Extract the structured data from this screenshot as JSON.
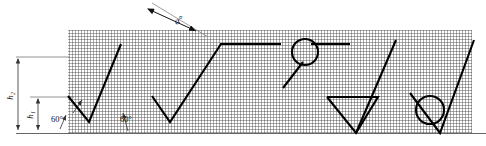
{
  "figure": {
    "type": "engineering-drawing",
    "canvas": {
      "width": 486,
      "height": 146
    },
    "colors": {
      "line": "#000000",
      "hatch": "#555555",
      "thin_line": "#777777",
      "background": "#ffffff"
    }
  },
  "block": {
    "name": "hatched-material-block",
    "x": 68,
    "y": 30,
    "width": 404,
    "height": 103,
    "hatch_spacing_px": 3
  },
  "baseline": {
    "x1": 16,
    "y1": 133,
    "x2": 486,
    "y2": 133
  },
  "dimensions": [
    {
      "id": "h2",
      "label": "h₂",
      "label_text": "h2",
      "orientation": "vertical",
      "x": 18,
      "y_top": 57,
      "y_bottom": 131,
      "label_x": 12,
      "label_y": 94
    },
    {
      "id": "h1",
      "label": "h₁",
      "label_text": "h1",
      "orientation": "vertical",
      "x": 38,
      "y_top": 97,
      "y_bottom": 131,
      "label_x": 32,
      "label_y": 114
    }
  ],
  "extension_lines": [
    {
      "x1": 16,
      "y1": 57,
      "x2": 70,
      "y2": 57
    },
    {
      "x1": 30,
      "y1": 97,
      "x2": 72,
      "y2": 97
    },
    {
      "x1": 16,
      "y1": 133,
      "x2": 72,
      "y2": 133
    }
  ],
  "angle_callouts": [
    {
      "id": "angle-left",
      "label": "60°",
      "text": "60°",
      "x": 57,
      "y": 121,
      "leader_x1": 73,
      "leader_y1": 115,
      "leader_x2": 82,
      "leader_y2": 101
    },
    {
      "id": "angle-middle",
      "label": "60°",
      "text": "60°",
      "x": 114,
      "y": 121,
      "leader_x1": 127,
      "leader_y1": 128,
      "leader_x2": 122,
      "leader_y2": 108
    }
  ],
  "top_angle": {
    "id": "alpha-angle",
    "label": "α°",
    "text": "α°",
    "label_x": 179,
    "label_y": 22,
    "arrow_from": {
      "x": 147,
      "y": 8
    },
    "arrow_to": {
      "x": 196,
      "y": 30
    },
    "ray": {
      "x1": 153,
      "y1": 2,
      "x2": 206,
      "y2": 36
    }
  },
  "profile": {
    "name": "sawtooth-thread-profile",
    "points": "68,97 88,122 120,45 152,97 152,97 168,122 172,122 172,122 220,45 280,45"
  },
  "profile_segments": [
    {
      "name": "flank-1-down",
      "points": "68,96 89,122"
    },
    {
      "name": "flank-1-up",
      "points": "89,122 121,44"
    },
    {
      "name": "flank-2-down",
      "points": "152,96 170,122"
    },
    {
      "name": "flank-2-up",
      "points": "170,122 221,44"
    },
    {
      "name": "crest-flat-1",
      "points": "221,44 281,44"
    },
    {
      "name": "crest-flat-2",
      "points": "311,44 350,44"
    },
    {
      "name": "vee-3-left",
      "points": "327,97 356,133"
    },
    {
      "name": "vee-3-top",
      "points": "327,97 378,97"
    },
    {
      "name": "vee-3-right",
      "points": "356,133 396,40"
    },
    {
      "name": "vee-4-left",
      "points": "410,93 440,133"
    },
    {
      "name": "vee-4-right",
      "points": "440,133 474,40"
    },
    {
      "name": "tangent-leader",
      "points": "283,88 303,62"
    }
  ],
  "circles": [
    {
      "id": "ball-upper",
      "cx": 305,
      "cy": 52,
      "r": 13,
      "name": "measuring-ball-upper"
    },
    {
      "id": "ball-lower",
      "cx": 430,
      "cy": 110,
      "r": 14,
      "name": "measuring-ball-lower"
    }
  ]
}
